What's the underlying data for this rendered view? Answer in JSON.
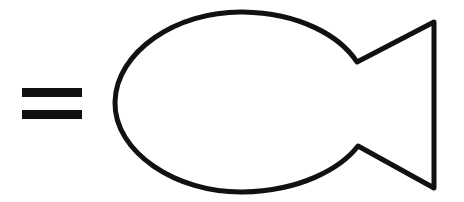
{
  "image": {
    "kind": "line-drawing",
    "subject": "fish outline preceded by an equals sign",
    "width": 464,
    "height": 202,
    "background_color": "#ffffff",
    "ink_color": "#111111",
    "stroke_width": 5,
    "alt_text": "An equals sign followed by a simple outline drawing of a fish"
  },
  "elements": {
    "equals_sign": {
      "name": "equals-sign",
      "symbol": "=",
      "color": "#111111",
      "bars": [
        {
          "label": "upper-bar",
          "x": 22,
          "y": 88,
          "width": 60,
          "height": 9
        },
        {
          "label": "lower-bar",
          "x": 22,
          "y": 110,
          "width": 60,
          "height": 9
        }
      ]
    },
    "fish": {
      "name": "fish-drawing",
      "color": "#111111",
      "parts": [
        {
          "label": "body",
          "shape": "oval",
          "left_x": 115,
          "top_y": 12,
          "bottom_y": 192,
          "right_x": 357
        },
        {
          "label": "tail",
          "shape": "triangular-fin",
          "notch_top": [
            357,
            62
          ],
          "notch_bottom": [
            358,
            146
          ],
          "tip_top": [
            434,
            22
          ],
          "tip_bottom": [
            434,
            188
          ]
        }
      ],
      "outline_path": "M 357 62 C 340 36 300 13 243 12 C 176 11 116 52 115 102 C 114 152 176 193 243 192 C 301 191 341 168 358 146 L 434 188 L 434 22 Z"
    }
  }
}
